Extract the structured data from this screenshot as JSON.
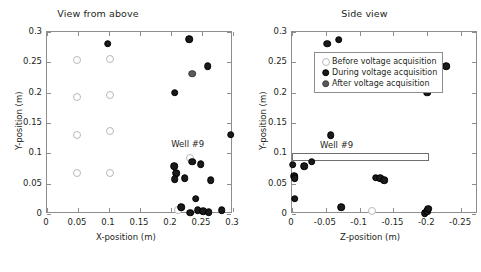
{
  "chart_data": [
    {
      "type": "scatter",
      "panel_id": "view-from-above",
      "title": "View from above",
      "xlabel": "X-position (m)",
      "ylabel": "Y-position (m)",
      "xlim": [
        0,
        0.3
      ],
      "ylim": [
        0,
        0.3
      ],
      "xticks": [
        0,
        0.05,
        0.1,
        0.15,
        0.2,
        0.25,
        0.3
      ],
      "xticklabels": [
        "0",
        "0.05",
        "0.1",
        "0.15",
        "0.2",
        "0.25",
        "0.3"
      ],
      "yticks": [
        0,
        0.05,
        0.1,
        0.15,
        0.2,
        0.25,
        0.3
      ],
      "yticklabels": [
        "0",
        "0.05",
        "0.1",
        "0.15",
        "0.2",
        "0.25",
        "0.3"
      ],
      "grid": false,
      "x_reversed": false,
      "series": [
        {
          "name": "Before voltage acquisition",
          "marker": "open-circle",
          "color": "#ffffff",
          "edge_color": "#b9b9b9",
          "points": [
            [
              0.049,
              0.254
            ],
            [
              0.102,
              0.255
            ],
            [
              0.049,
              0.193
            ],
            [
              0.102,
              0.196
            ],
            [
              0.049,
              0.131
            ],
            [
              0.101,
              0.136
            ],
            [
              0.049,
              0.068
            ],
            [
              0.101,
              0.068
            ],
            [
              0.231,
              0.093
            ],
            [
              0.212,
              0.007
            ]
          ]
        },
        {
          "name": "During voltage acquisition",
          "marker": "filled-circle",
          "color": "#1a1a1a",
          "points": [
            [
              0.098,
              0.281
            ],
            [
              0.229,
              0.288
            ],
            [
              0.259,
              0.244
            ],
            [
              0.206,
              0.2
            ],
            [
              0.296,
              0.131
            ],
            [
              0.234,
              0.086
            ],
            [
              0.248,
              0.082
            ],
            [
              0.205,
              0.079
            ],
            [
              0.208,
              0.067
            ],
            [
              0.222,
              0.059
            ],
            [
              0.206,
              0.057
            ],
            [
              0.264,
              0.056
            ],
            [
              0.24,
              0.025
            ],
            [
              0.216,
              0.011
            ],
            [
              0.231,
              0.002
            ],
            [
              0.243,
              0.006
            ],
            [
              0.252,
              0.005
            ],
            [
              0.261,
              0.003
            ],
            [
              0.282,
              0.006
            ]
          ]
        },
        {
          "name": "After voltage acquisition",
          "marker": "filled-circle-gray",
          "color": "#5a5a5a",
          "points": [
            [
              0.234,
              0.231
            ]
          ]
        }
      ],
      "annotations": [
        {
          "text": "Well #9",
          "x": 0.227,
          "y": 0.113
        }
      ]
    },
    {
      "type": "scatter",
      "panel_id": "side-view",
      "title": "Side view",
      "xlabel": "Z-position (m)",
      "ylabel": "Y-position (m)",
      "xlim": [
        0,
        -0.275
      ],
      "ylim": [
        0,
        0.3
      ],
      "xticks": [
        0,
        -0.05,
        -0.1,
        -0.15,
        -0.2,
        -0.25
      ],
      "xticklabels": [
        "0",
        "-0.05",
        "-0.1",
        "-0.15",
        "-0.2",
        "-0.25"
      ],
      "yticks": [
        0,
        0.05,
        0.1,
        0.15,
        0.2,
        0.25,
        0.3
      ],
      "yticklabels": [
        "0",
        "0.05",
        "0.1",
        "0.15",
        "0.2",
        "0.25",
        "0.3"
      ],
      "grid": false,
      "x_reversed": true,
      "series": [
        {
          "name": "Before voltage acquisition",
          "marker": "open-circle",
          "color": "#ffffff",
          "edge_color": "#b9b9b9",
          "points": [
            [
              -0.118,
              0.005
            ]
          ]
        },
        {
          "name": "During voltage acquisition",
          "marker": "filled-circle",
          "color": "#1a1a1a",
          "points": [
            [
              -0.052,
              0.281
            ],
            [
              -0.069,
              0.287
            ],
            [
              -0.228,
              0.244
            ],
            [
              -0.2,
              0.2
            ],
            [
              -0.057,
              0.13
            ],
            [
              -0.001,
              0.081
            ],
            [
              -0.018,
              0.079
            ],
            [
              -0.029,
              0.086
            ],
            [
              -0.003,
              0.062
            ],
            [
              -0.004,
              0.059
            ],
            [
              -0.124,
              0.06
            ],
            [
              -0.13,
              0.059
            ],
            [
              -0.136,
              0.056
            ],
            [
              -0.004,
              0.025
            ],
            [
              -0.073,
              0.011
            ],
            [
              -0.196,
              0.001
            ],
            [
              -0.2,
              0.005
            ],
            [
              -0.201,
              0.009
            ]
          ]
        },
        {
          "name": "After voltage acquisition",
          "marker": "filled-circle-gray",
          "color": "#5a5a5a",
          "points": []
        }
      ],
      "annotations": [
        {
          "text": "Well #9",
          "x": -0.066,
          "y": 0.112
        }
      ],
      "shapes": [
        {
          "kind": "rectangle",
          "label": "Well #9",
          "x0": 0.0,
          "x1": -0.202,
          "y0": 0.087,
          "y1": 0.1
        }
      ],
      "legend": {
        "position": "upper-left-inside",
        "entries": [
          {
            "label": "Before voltage acquisition",
            "marker": "open-circle"
          },
          {
            "label": "During voltage acquisition",
            "marker": "filled-circle"
          },
          {
            "label": "After voltage acquisition",
            "marker": "filled-circle-gray"
          }
        ]
      }
    }
  ],
  "colors": {
    "axis": "#8d8d8d",
    "text": "#231f20",
    "during": "#1a1a1a",
    "after": "#5a5a5a",
    "before_edge": "#b9b9b9",
    "background": "#ffffff"
  }
}
